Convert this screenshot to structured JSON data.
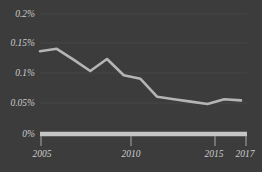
{
  "chart_data": {
    "type": "line",
    "title": "",
    "subtitle": "",
    "xlabel": "",
    "ylabel": "",
    "x": [
      2005,
      2006,
      2007,
      2008,
      2009,
      2010,
      2011,
      2012,
      2013,
      2014,
      2015,
      2016,
      2017
    ],
    "values": [
      0.138,
      0.142,
      0.124,
      0.105,
      0.125,
      0.098,
      0.092,
      0.062,
      0.058,
      0.054,
      0.05,
      0.058,
      0.056
    ],
    "series": [
      {
        "name": "rate",
        "values": [
          0.138,
          0.142,
          0.124,
          0.105,
          0.125,
          0.098,
          0.092,
          0.062,
          0.058,
          0.054,
          0.05,
          0.058,
          0.056
        ]
      }
    ],
    "xlim": [
      2005,
      2017
    ],
    "ylim": [
      0,
      0.2
    ],
    "y_ticks": [
      0,
      0.05,
      0.1,
      0.15,
      0.2
    ],
    "y_tick_labels": [
      "0%",
      "0.05%",
      "0.1%",
      "0.15%",
      "0.2%"
    ],
    "x_ticks": [
      2005,
      2010,
      2015,
      2017
    ],
    "x_tick_labels": [
      "2005",
      "2010",
      "2015",
      "2017"
    ],
    "grid": true,
    "legend": "none",
    "units": "percent",
    "colors": {
      "background": "#3b3b3b",
      "line": "#b6b6b6",
      "axis": "#c6c6c6",
      "text": "#cfcfcf",
      "gridline": "#4a4a4a"
    }
  },
  "axis": {
    "y_labels": [
      "0.2%",
      "0.15%",
      "0.1%",
      "0.05%",
      "0%"
    ],
    "x_labels": [
      "2005",
      "2010",
      "2015",
      "2017"
    ]
  }
}
